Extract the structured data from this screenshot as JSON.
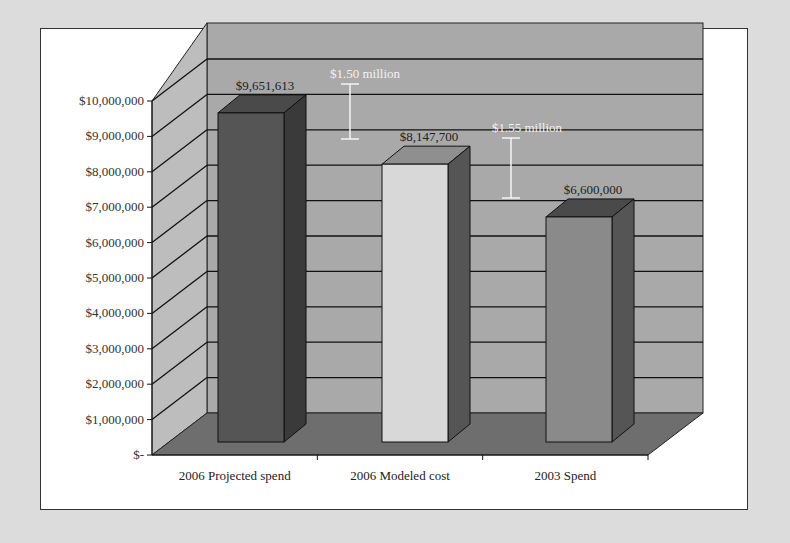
{
  "chart_data": {
    "type": "bar",
    "style": "3d-column",
    "title": "",
    "xlabel": "",
    "ylabel": "",
    "categories": [
      "2006 Projected spend",
      "2006 Modeled cost",
      "2003 Spend"
    ],
    "values": [
      9651613,
      8147700,
      6600000
    ],
    "value_labels": [
      "$9,651,613",
      "$8,147,700",
      "$6,600,000"
    ],
    "bar_colors": [
      "#555555",
      "#d8d8d8",
      "#8a8a8a"
    ],
    "ylim": [
      0,
      10000000
    ],
    "y_ticks": [
      "$-",
      "$1,000,000",
      "$2,000,000",
      "$3,000,000",
      "$4,000,000",
      "$5,000,000",
      "$6,000,000",
      "$7,000,000",
      "$8,000,000",
      "$9,000,000",
      "$10,000,000"
    ],
    "grid": true,
    "legend": null,
    "annotations": [
      {
        "text": "$1.50 million",
        "between": [
          "2006 Projected spend",
          "2006 Modeled cost"
        ]
      },
      {
        "text": "$1.55 million",
        "between": [
          "2006 Modeled cost",
          "2003 Spend"
        ]
      }
    ]
  }
}
